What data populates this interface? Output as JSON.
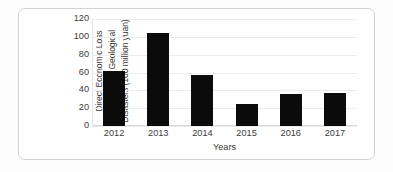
{
  "chart_data": {
    "type": "bar",
    "title": "",
    "categories": [
      "2012",
      "2013",
      "2014",
      "2015",
      "2016",
      "2017"
    ],
    "values": [
      62,
      104,
      57,
      25,
      36,
      37
    ],
    "xlabel": "Years",
    "ylabel_lines": [
      "Direct Economic Loss",
      "Caused by Geological",
      "Disasters (100 million yuan)"
    ],
    "ylabel": "Direct Economic Loss Caused by Geological Disasters (100 million yuan)",
    "yticks": [
      0,
      20,
      40,
      60,
      80,
      100,
      120
    ],
    "ytick_labels": [
      "0",
      "20",
      "40",
      "60",
      "80",
      "100",
      "120"
    ],
    "ylim": [
      0,
      120
    ],
    "grid": true,
    "legend": false,
    "bar_color": "#0b0b0b",
    "grid_color": "#ececec",
    "axis_color": "#d8d8d8",
    "background": "#ffffff"
  }
}
